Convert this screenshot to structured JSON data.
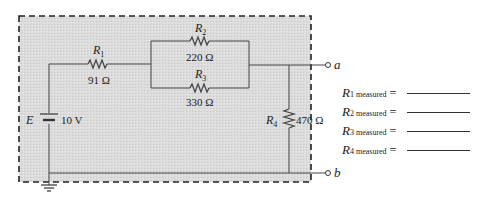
{
  "circuit": {
    "source": {
      "label": "E",
      "value": "10 V"
    },
    "resistors": [
      {
        "id": "R1",
        "name": "R",
        "sub": "1",
        "value": "91 Ω"
      },
      {
        "id": "R2",
        "name": "R",
        "sub": "2",
        "value": "220 Ω"
      },
      {
        "id": "R3",
        "name": "R",
        "sub": "3",
        "value": "330 Ω"
      },
      {
        "id": "R4",
        "name": "R",
        "sub": "4",
        "value": "470 Ω"
      }
    ],
    "terminals": [
      {
        "label": "a"
      },
      {
        "label": "b"
      }
    ]
  },
  "measurements": [
    {
      "name": "R",
      "sub": "1 measured",
      "eq": "="
    },
    {
      "name": "R",
      "sub": "2 measured",
      "eq": "="
    },
    {
      "name": "R",
      "sub": "3 measured",
      "eq": "="
    },
    {
      "name": "R",
      "sub": "4 measured",
      "eq": "="
    }
  ],
  "colors": {
    "box_fill": "#d9d9d9",
    "wire": "#444444",
    "dash": "#222222"
  }
}
